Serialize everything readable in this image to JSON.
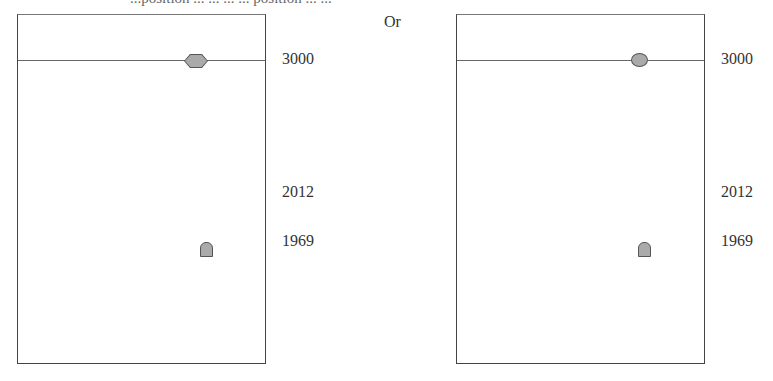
{
  "header": {
    "cut_text": "...position ... ... ... ... position ... ...",
    "or_label": "Or"
  },
  "panels": [
    {
      "id": "left",
      "marker_top": "hexagon",
      "marker_bottom": "tombstone",
      "labels": {
        "top": "3000",
        "mid": "2012",
        "low": "1969"
      }
    },
    {
      "id": "right",
      "marker_top": "oval",
      "marker_bottom": "tombstone",
      "labels": {
        "top": "3000",
        "mid": "2012",
        "low": "1969"
      }
    }
  ]
}
